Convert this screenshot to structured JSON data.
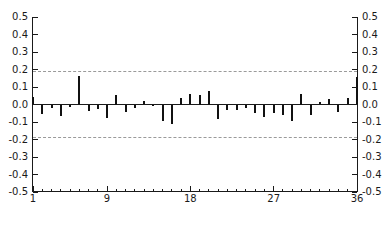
{
  "chart_data": {
    "type": "bar",
    "title": "",
    "subtitle": "",
    "xlabel": "",
    "ylabel": "",
    "orientation": "vertical",
    "grid": false,
    "legend": null,
    "ylim": [
      -0.5,
      0.5
    ],
    "xlim": [
      1,
      36
    ],
    "y_ticks": [
      0.5,
      0.4,
      0.3,
      0.2,
      0.1,
      0.0,
      -0.1,
      -0.2,
      -0.3,
      -0.4,
      -0.5
    ],
    "y_tick_labels": [
      "0.5",
      "0.4",
      "0.3",
      "0.2",
      "0.1",
      "0.0",
      "-0.1",
      "-0.2",
      "-0.3",
      "-0.4",
      "-0.5"
    ],
    "y_axis_duplicated_right": true,
    "x_ticks_major": [
      1,
      9,
      18,
      27,
      36
    ],
    "x_tick_labels": [
      "1",
      "9",
      "18",
      "27",
      "36"
    ],
    "x_minor_tick_every": 1,
    "zero_line": 0.0,
    "annotations": [
      {
        "name": "upper-confidence-band",
        "value": 0.19,
        "style": "dashed",
        "color": "#9a9a9a"
      },
      {
        "name": "lower-confidence-band",
        "value": -0.19,
        "style": "dashed",
        "color": "#9a9a9a"
      }
    ],
    "bar_color": "#111111",
    "axis_color": "#1a1a1a",
    "categories": [
      1,
      2,
      3,
      4,
      5,
      6,
      7,
      8,
      9,
      10,
      11,
      12,
      13,
      14,
      15,
      16,
      17,
      18,
      19,
      20,
      21,
      22,
      23,
      24,
      25,
      26,
      27,
      28,
      29,
      30,
      31,
      32,
      33,
      34,
      35,
      36
    ],
    "values": [
      0.045,
      -0.055,
      -0.018,
      -0.068,
      -0.015,
      0.165,
      -0.038,
      -0.028,
      -0.075,
      0.055,
      -0.042,
      -0.022,
      0.018,
      -0.005,
      -0.095,
      -0.11,
      0.04,
      0.062,
      0.055,
      0.075,
      -0.08,
      -0.03,
      -0.032,
      -0.022,
      -0.048,
      -0.072,
      -0.05,
      -0.058,
      -0.095,
      0.06,
      -0.058,
      0.012,
      0.03,
      -0.042,
      0.038,
      0.155
    ]
  }
}
